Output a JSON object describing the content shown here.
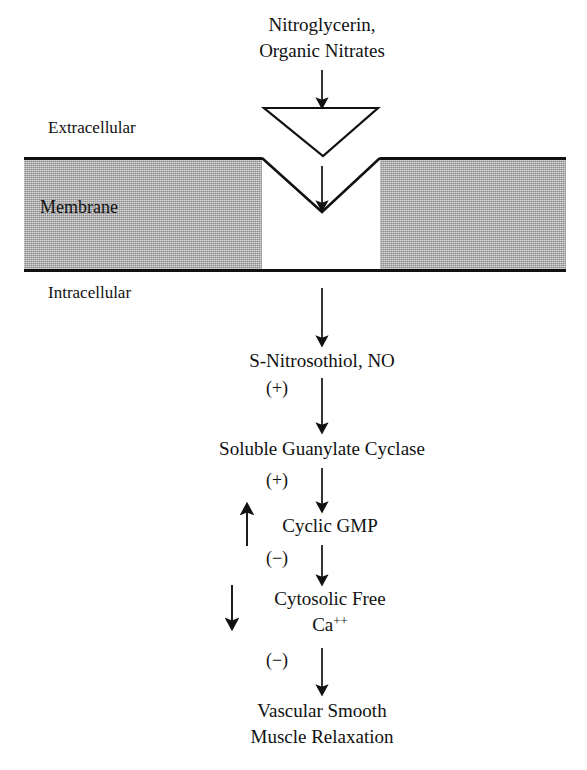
{
  "figure": {
    "title_lines": [
      "Nitroglycerin,",
      "Organic Nitrates"
    ],
    "colors": {
      "membrane_fill": "#adadad",
      "stroke": "#111111",
      "background": "#ffffff",
      "pocket_fill": "#ffffff"
    }
  },
  "membrane": {
    "extracellular_label": "Extracellular",
    "intracellular_label": "Intracellular",
    "membrane_label": "Membrane",
    "pocket": {
      "cysteine_label": "Cysteine",
      "thiol_left": "SH",
      "thiol_right": "SH"
    },
    "ligand": {
      "symbol": "N"
    }
  },
  "cascade": {
    "steps": [
      {
        "id": "step-nitrosothiol",
        "lines": [
          "S-Nitrosothiol, NO"
        ]
      },
      {
        "id": "step-guanylate-cyclase",
        "lines": [
          "Soluble Guanylate Cyclase"
        ]
      },
      {
        "id": "step-cyclic-gmp",
        "lines": [
          "Cyclic GMP"
        ]
      },
      {
        "id": "step-cytosolic-calcium",
        "lines": [
          "Cytosolic Free",
          "Ca"
        ],
        "superscript": "++"
      },
      {
        "id": "step-vascular-relaxation",
        "lines": [
          "Vascular Smooth",
          "Muscle Relaxation"
        ]
      }
    ],
    "signs": [
      {
        "id": "sign-plus-1",
        "label": "(+)"
      },
      {
        "id": "sign-plus-2",
        "label": "(+)"
      },
      {
        "id": "sign-minus-1",
        "label": "(−)"
      },
      {
        "id": "sign-minus-2",
        "label": "(−)"
      }
    ],
    "change_arrows": [
      {
        "id": "cgmp-increase-arrow",
        "direction": "up"
      },
      {
        "id": "calcium-decrease-arrow",
        "direction": "down"
      }
    ]
  }
}
